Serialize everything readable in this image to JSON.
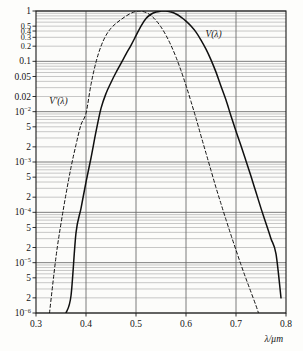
{
  "figure": {
    "background_color": "#fdfdfb",
    "plot_frame_color": "#1a1a1a",
    "major_grid_color": "#6e6e6e",
    "minor_grid_color": "#9a9a9a",
    "curve_color": "#101010"
  },
  "axes": {
    "x_axis_title": "λ/μm",
    "y_axis_title": "",
    "x_tick_labels": [
      "0.3",
      "0.4",
      "0.5",
      "0.6",
      "0.7",
      "0.8"
    ],
    "x_tick_values": [
      0.3,
      0.4,
      0.5,
      0.6,
      0.7,
      0.8
    ],
    "x_range": [
      0.3,
      0.8
    ],
    "y_range": [
      1e-06,
      1
    ],
    "y_scale": "log",
    "y_ticks": [
      {
        "value": 1,
        "label": "1",
        "sup": ""
      },
      {
        "value": 0.5,
        "label": "0.5",
        "sup": ""
      },
      {
        "value": 0.4,
        "label": "0.4",
        "sup": ""
      },
      {
        "value": 0.3,
        "label": "0.3",
        "sup": ""
      },
      {
        "value": 0.2,
        "label": "0.2",
        "sup": ""
      },
      {
        "value": 0.1,
        "label": "0.1",
        "sup": ""
      },
      {
        "value": 0.05,
        "label": "0.05",
        "sup": ""
      },
      {
        "value": 0.02,
        "label": "0.02",
        "sup": ""
      },
      {
        "value": 0.01,
        "label": "10",
        "sup": "−2"
      },
      {
        "value": 0.005,
        "label": "5",
        "sup": ""
      },
      {
        "value": 0.002,
        "label": "2",
        "sup": ""
      },
      {
        "value": 0.001,
        "label": "10",
        "sup": "−3"
      },
      {
        "value": 0.0005,
        "label": "5",
        "sup": ""
      },
      {
        "value": 0.0002,
        "label": "2",
        "sup": ""
      },
      {
        "value": 0.0001,
        "label": "10",
        "sup": "−4"
      },
      {
        "value": 5e-05,
        "label": "5",
        "sup": ""
      },
      {
        "value": 2e-05,
        "label": "2",
        "sup": ""
      },
      {
        "value": 1e-05,
        "label": "10",
        "sup": "−5"
      },
      {
        "value": 5e-06,
        "label": "5",
        "sup": ""
      },
      {
        "value": 2e-06,
        "label": "2",
        "sup": ""
      },
      {
        "value": 1e-06,
        "label": "10",
        "sup": "−6"
      }
    ]
  },
  "annotations": [
    {
      "name": "photopic-curve-label",
      "text": "V(λ)",
      "x": 0.655,
      "y": 0.3
    },
    {
      "name": "scotopic-curve-label",
      "text": "V'(λ)",
      "x": 0.345,
      "y": 0.0145
    }
  ],
  "chart_data": {
    "type": "line",
    "title": "",
    "subtitle": "",
    "xlabel": "λ/μm",
    "ylabel": "",
    "xlim": [
      0.3,
      0.8
    ],
    "ylim": [
      1e-06,
      1
    ],
    "yscale": "log",
    "grid": true,
    "legend_position": "inline-annotation",
    "series": [
      {
        "name": "V(λ)",
        "style": "solid",
        "color": "#101010",
        "description": "CIE photopic luminous efficiency function, peak at 0.555 μm",
        "peak_x": 0.555,
        "peak_y": 1.0,
        "x": [
          0.36,
          0.37,
          0.38,
          0.39,
          0.4,
          0.41,
          0.42,
          0.43,
          0.44,
          0.45,
          0.46,
          0.47,
          0.48,
          0.49,
          0.5,
          0.51,
          0.52,
          0.53,
          0.54,
          0.55,
          0.555,
          0.56,
          0.57,
          0.58,
          0.59,
          0.6,
          0.61,
          0.62,
          0.63,
          0.64,
          0.65,
          0.66,
          0.67,
          0.68,
          0.69,
          0.7,
          0.71,
          0.72,
          0.73,
          0.74,
          0.75,
          0.76,
          0.77,
          0.78,
          0.79
        ],
        "y": [
          1e-06,
          2.2e-06,
          3.9e-05,
          0.00012,
          0.0004,
          0.0012,
          0.004,
          0.0116,
          0.023,
          0.038,
          0.06,
          0.091,
          0.139,
          0.208,
          0.323,
          0.503,
          0.71,
          0.862,
          0.954,
          0.995,
          1.0,
          0.995,
          0.952,
          0.87,
          0.757,
          0.631,
          0.503,
          0.381,
          0.265,
          0.175,
          0.107,
          0.061,
          0.032,
          0.017,
          0.0082,
          0.0041,
          0.0021,
          0.00105,
          0.00052,
          0.00025,
          0.00012,
          6e-05,
          3e-05,
          1.5e-05,
          2e-06
        ]
      },
      {
        "name": "V'(λ)",
        "style": "dashed",
        "color": "#101010",
        "description": "CIE scotopic luminous efficiency function, peak at 0.507 μm",
        "peak_x": 0.507,
        "peak_y": 1.0,
        "x": [
          0.327,
          0.34,
          0.35,
          0.36,
          0.37,
          0.38,
          0.39,
          0.4,
          0.41,
          0.42,
          0.43,
          0.44,
          0.45,
          0.46,
          0.47,
          0.48,
          0.49,
          0.5,
          0.507,
          0.51,
          0.52,
          0.53,
          0.54,
          0.55,
          0.56,
          0.57,
          0.58,
          0.59,
          0.6,
          0.61,
          0.62,
          0.63,
          0.64,
          0.65,
          0.66,
          0.67,
          0.68,
          0.69,
          0.7,
          0.71,
          0.72,
          0.73,
          0.74,
          0.745
        ],
        "y": [
          1e-06,
          1.3e-05,
          6e-05,
          0.00023,
          0.00078,
          0.0022,
          0.0055,
          0.0093,
          0.0348,
          0.0966,
          0.1998,
          0.3281,
          0.455,
          0.567,
          0.676,
          0.793,
          0.904,
          0.982,
          1.0,
          0.997,
          0.935,
          0.811,
          0.65,
          0.481,
          0.3288,
          0.2076,
          0.1212,
          0.0655,
          0.0332,
          0.0159,
          0.0074,
          0.0033,
          0.0015,
          0.00068,
          0.00031,
          0.000148,
          7.15e-05,
          3.53e-05,
          1.78e-05,
          9.1e-06,
          4.8e-06,
          2.6e-06,
          1.4e-06,
          1e-06
        ]
      }
    ]
  }
}
